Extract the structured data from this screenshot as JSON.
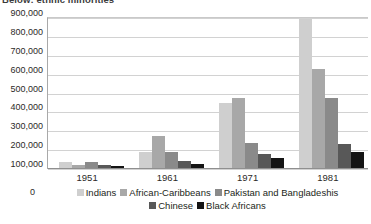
{
  "chart_data": {
    "type": "bar",
    "title": "Below: ethnic minorities",
    "xlabel": "",
    "ylabel": "",
    "categories": [
      "1951",
      "1961",
      "1971",
      "1981"
    ],
    "ylim": [
      100000,
      900000
    ],
    "yticks": [
      "100,000",
      "200,000",
      "300,000",
      "400,000",
      "500,000",
      "600,000",
      "700,000",
      "800,000",
      "900,000"
    ],
    "ytick_values": [
      100000,
      200000,
      300000,
      400000,
      500000,
      600000,
      700000,
      800000,
      900000
    ],
    "axis_origin_label": "0",
    "grid": true,
    "legend_position": "bottom",
    "series": [
      {
        "name": "Indians",
        "color": "#cfcfcf",
        "values": [
          130000,
          185000,
          447000,
          888000
        ]
      },
      {
        "name": "African-Caribbeans",
        "color": "#a8a8a8",
        "values": [
          115000,
          272000,
          470000,
          626000
        ]
      },
      {
        "name": "Pakistan and Bangladeshis",
        "color": "#8a8a8a",
        "values": [
          132000,
          186000,
          232000,
          472000
        ]
      },
      {
        "name": "Chinese",
        "color": "#585858",
        "values": [
          118000,
          138000,
          172000,
          226000
        ]
      },
      {
        "name": "Black Africans",
        "color": "#141414",
        "values": [
          112000,
          120000,
          153000,
          184000
        ]
      }
    ]
  }
}
